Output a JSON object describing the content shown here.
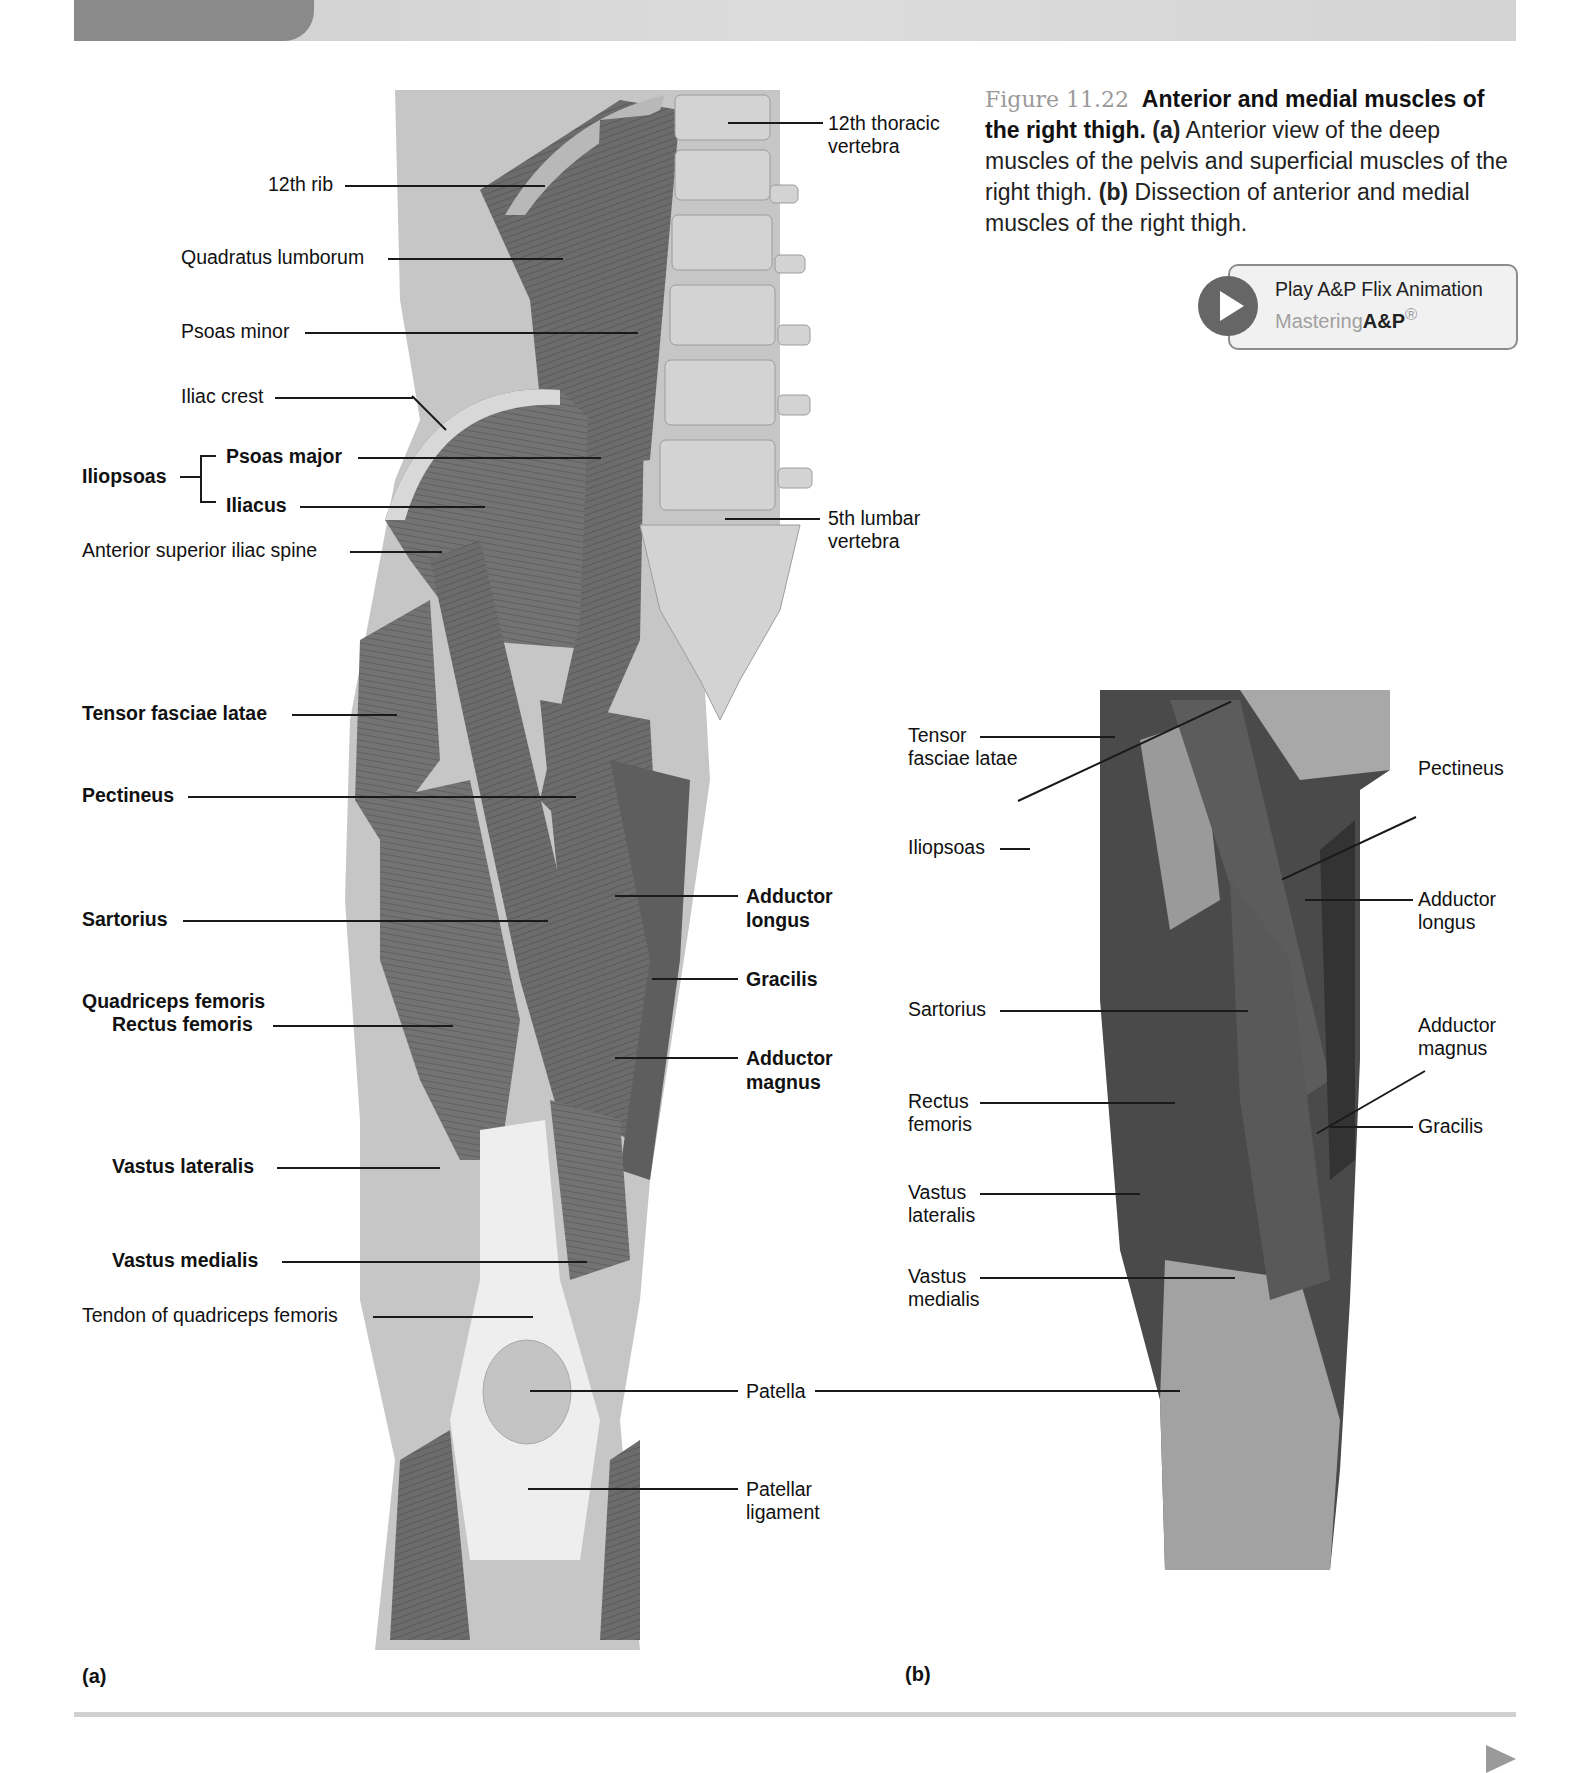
{
  "header": {
    "band": "decorative-header-band"
  },
  "caption": {
    "figure_number": "Figure 11.22",
    "title": "Anterior and medial muscles of the right thigh.",
    "part_a_tag": "(a)",
    "part_a_text": " Anterior view of the deep muscles of the pelvis and superficial muscles of the right thigh. ",
    "part_b_tag": "(b)",
    "part_b_text": " Dissection of anterior and medial muscles of the right thigh."
  },
  "flix_button": {
    "label": "Play A&P Flix Animation",
    "brand_light": "Mastering",
    "brand_bold": "A&P",
    "brand_mark": "®",
    "icon": "play-icon"
  },
  "panel_a": {
    "tag": "(a)",
    "left_labels": {
      "rib12": "12th rib",
      "quadratus": "Quadratus lumborum",
      "psoas_minor": "Psoas minor",
      "iliac_crest": "Iliac crest",
      "iliopsoas": "Iliopsoas",
      "psoas_major": "Psoas major",
      "iliacus": "Iliacus",
      "asis": "Anterior superior iliac spine",
      "tensor": "Tensor fasciae latae",
      "pectineus": "Pectineus",
      "sartorius": "Sartorius",
      "quadriceps": "Quadriceps femoris",
      "rectus": "Rectus femoris",
      "vastus_lat": "Vastus lateralis",
      "vastus_med": "Vastus medialis",
      "tendon_quad": "Tendon of quadriceps femoris"
    },
    "right_labels": {
      "t12_line1": "12th thoracic",
      "t12_line2": "vertebra",
      "l5_line1": "5th lumbar",
      "l5_line2": "vertebra",
      "add_long_1": "Adductor",
      "add_long_2": "longus",
      "gracilis": "Gracilis",
      "add_mag_1": "Adductor",
      "add_mag_2": "magnus",
      "patella": "Patella",
      "pat_lig_1": "Patellar",
      "pat_lig_2": "ligament"
    }
  },
  "panel_b": {
    "tag": "(b)",
    "left_labels": {
      "tensor_1": "Tensor",
      "tensor_2": "fasciae latae",
      "iliopsoas": "Iliopsoas",
      "sartorius": "Sartorius",
      "rectus_1": "Rectus",
      "rectus_2": "femoris",
      "vlat_1": "Vastus",
      "vlat_2": "lateralis",
      "vmed_1": "Vastus",
      "vmed_2": "medialis"
    },
    "right_labels": {
      "pectineus": "Pectineus",
      "add_long_1": "Adductor",
      "add_long_2": "longus",
      "add_mag_1": "Adductor",
      "add_mag_2": "magnus",
      "gracilis": "Gracilis"
    }
  },
  "colors": {
    "muscle": "#6e6e6e",
    "muscle_dark": "#4a4a4a",
    "bone": "#cfcfcf",
    "tendon": "#ececec",
    "skin_bg": "#c4c4c4",
    "figure_number": "#9a9a9a"
  }
}
